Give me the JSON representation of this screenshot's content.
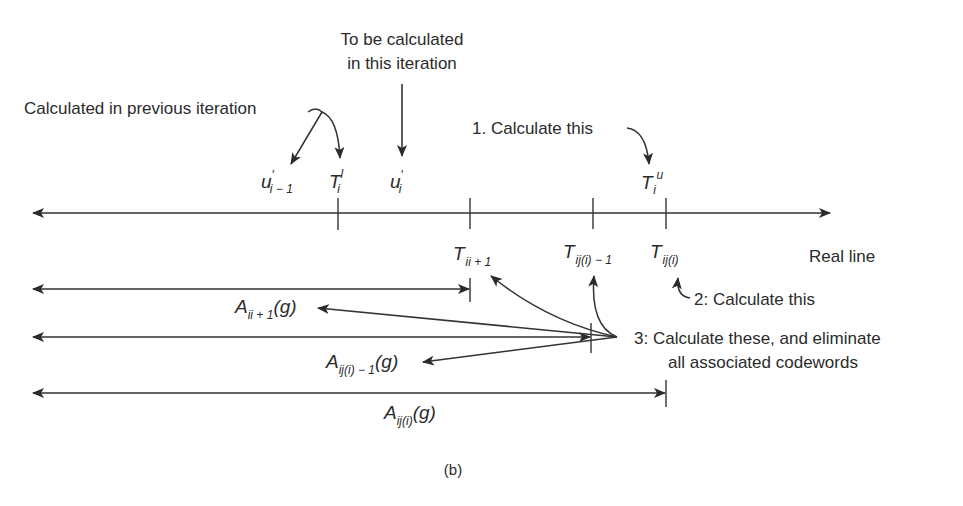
{
  "figure": {
    "caption": "(b)",
    "axis_label": "Real line",
    "colors": {
      "ink": "#2b2b2b",
      "background": "#ffffff"
    },
    "annotations": {
      "previous_iteration": "Calculated in previous iteration",
      "this_iteration_line1": "To be calculated",
      "this_iteration_line2": "in this iteration",
      "step1": "1. Calculate this",
      "step2": "2: Calculate this",
      "step3_line1": "3: Calculate these, and eliminate",
      "step3_line2": "all associated codewords"
    },
    "upper_symbols": {
      "u_prev": {
        "base": "u",
        "prime": "′",
        "sub": "i − 1"
      },
      "T_lower": {
        "base": "T",
        "sub": "i",
        "sup": "l"
      },
      "u_curr": {
        "base": "u",
        "prime": "′",
        "sub": "i"
      },
      "T_upper": {
        "base": "T",
        "sub": "i",
        "sup": "u"
      }
    },
    "lower_symbols": {
      "T_ii1": {
        "base": "T",
        "sub": "ii + 1"
      },
      "T_iji1": {
        "base": "T",
        "sub": "ij(i) − 1"
      },
      "T_iji": {
        "base": "T",
        "sub": "ij(i)"
      }
    },
    "interval_labels": {
      "A_ii1": {
        "base": "A",
        "sub": "ii + 1",
        "arg": "(g)"
      },
      "A_iji1": {
        "base": "A",
        "sub": "ij(i) − 1",
        "arg": "(g)"
      },
      "A_iji": {
        "base": "A",
        "sub": "ij(i)",
        "arg": "(g)"
      }
    }
  }
}
